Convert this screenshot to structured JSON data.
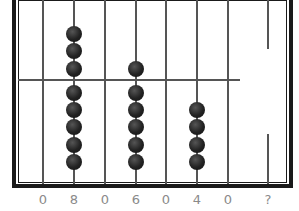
{
  "abacus": {
    "rods": [
      {
        "label": "0",
        "upper_beads": 0,
        "lower_beads": 0
      },
      {
        "label": "8",
        "upper_beads": 3,
        "lower_beads": 5
      },
      {
        "label": "0",
        "upper_beads": 0,
        "lower_beads": 0
      },
      {
        "label": "6",
        "upper_beads": 1,
        "lower_beads": 5
      },
      {
        "label": "0",
        "upper_beads": 0,
        "lower_beads": 0
      },
      {
        "label": "4",
        "upper_beads": 0,
        "lower_beads": 4
      },
      {
        "label": "0",
        "upper_beads": 0,
        "lower_beads": 0
      },
      {
        "label": "?",
        "upper_beads": 0,
        "lower_beads": 0
      }
    ],
    "bead_color": "#222222",
    "frame_color": "#1a1a1a",
    "label_color": "#8a8a8a"
  }
}
